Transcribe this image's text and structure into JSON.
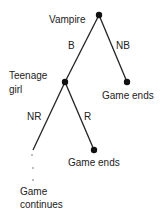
{
  "diagram": {
    "type": "game-tree",
    "nodes": {
      "root": {
        "label": "Vampire"
      },
      "teen": {
        "label_line1": "Teenage",
        "label_line2": "girl"
      },
      "leaf1": {
        "label": "Game ends"
      },
      "leaf2": {
        "label": "Game ends"
      },
      "continue": {
        "label_line1": "Game",
        "label_line2": "continues"
      }
    },
    "edges": {
      "b": {
        "label": "B"
      },
      "nb": {
        "label": "NB"
      },
      "nr": {
        "label": "NR"
      },
      "r": {
        "label": "R"
      }
    },
    "colors": {
      "line": "#222222",
      "node": "#111111"
    }
  }
}
